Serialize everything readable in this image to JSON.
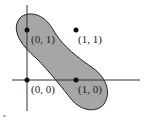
{
  "diagram": {
    "type": "xor-separation-region",
    "colors": {
      "region_fill": "#a6a6a6",
      "region_stroke": "#222222",
      "axis": "#333333",
      "point": "#111111",
      "label": "#222222"
    },
    "points": [
      {
        "label": "(0, 1)",
        "x": 0,
        "y": 1,
        "inside_region": true
      },
      {
        "label": "(1, 1)",
        "x": 1,
        "y": 1,
        "inside_region": false
      },
      {
        "label": "(0, 0)",
        "x": 0,
        "y": 0,
        "inside_region": false
      },
      {
        "label": "(1, 0)",
        "x": 1,
        "y": 0,
        "inside_region": true
      }
    ],
    "corner_mark": "w"
  }
}
